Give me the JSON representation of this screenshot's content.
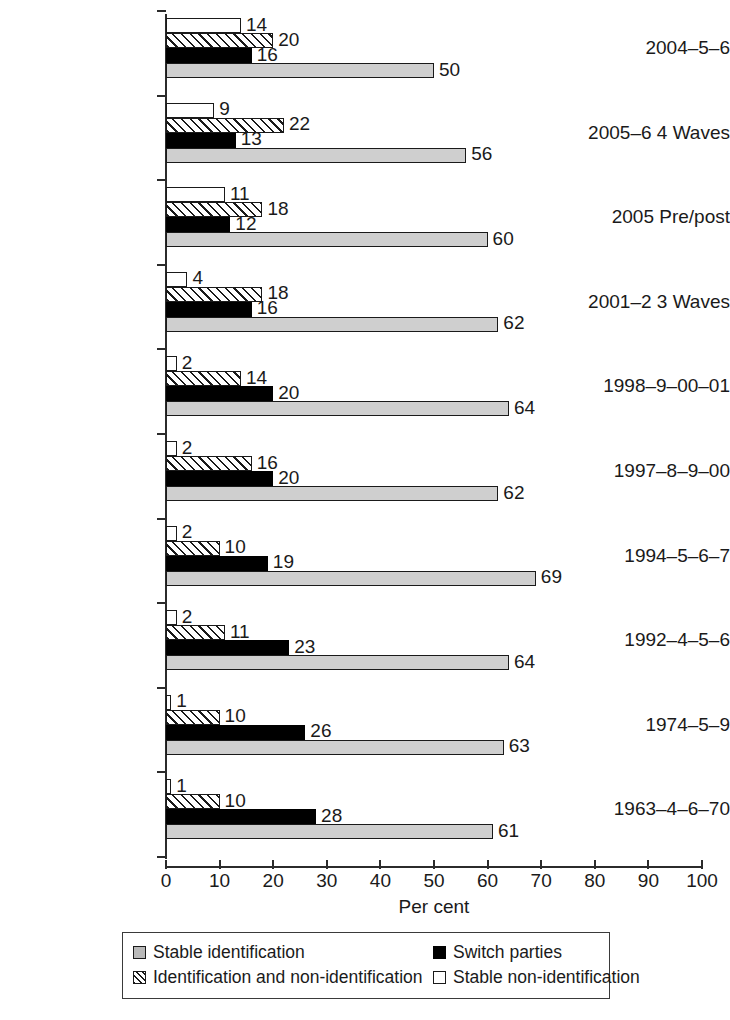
{
  "chart_data": {
    "type": "bar",
    "orientation": "horizontal",
    "title": "",
    "xlabel": "Per cent",
    "ylabel": "",
    "xlim": [
      0,
      100
    ],
    "xticks": [
      0,
      10,
      20,
      30,
      40,
      50,
      60,
      70,
      80,
      90,
      100
    ],
    "grid": false,
    "legend_position": "bottom",
    "categories": [
      "2004–5–6",
      "2005–6 4 Waves",
      "2005 Pre/post",
      "2001–2 3 Waves",
      "1998–9–00–01",
      "1997–8–9–00",
      "1994–5–6–7",
      "1992–4–5–6",
      "1974–5–9",
      "1963–4–6–70"
    ],
    "series": [
      {
        "name": "Stable non-identification",
        "style": "open-white",
        "values": [
          14,
          9,
          11,
          4,
          2,
          2,
          2,
          2,
          1,
          1
        ]
      },
      {
        "name": "Identification and non-identification",
        "style": "hatched",
        "values": [
          20,
          22,
          18,
          18,
          14,
          16,
          10,
          11,
          10,
          10
        ]
      },
      {
        "name": "Switch parties",
        "style": "solid-black",
        "values": [
          16,
          13,
          12,
          16,
          20,
          20,
          19,
          23,
          26,
          28
        ]
      },
      {
        "name": "Stable identification",
        "style": "grey-fill",
        "values": [
          50,
          56,
          60,
          62,
          64,
          62,
          69,
          64,
          63,
          61
        ]
      }
    ]
  },
  "legend": {
    "entries": [
      {
        "label": "Stable identification",
        "swatch": "grey-fill-square-icon",
        "swatch_class": "stable-id"
      },
      {
        "label": "Switch parties",
        "swatch": "black-filled-square-icon",
        "swatch_class": "switch"
      },
      {
        "label": "Identification and non-identification",
        "swatch": "hatched-square-icon",
        "swatch_class": "id-nonid"
      },
      {
        "label": "Stable non-identification",
        "swatch": "open-square-icon",
        "swatch_class": "stable-nonid"
      }
    ]
  },
  "colors": {
    "stable_identification": "#cfcfcf",
    "switch_parties": "#000000",
    "stable_non_identification": "#ffffff",
    "identification_and_non_identification": "#ffffff",
    "ink": "#1a1a1a",
    "background": "#ffffff"
  }
}
